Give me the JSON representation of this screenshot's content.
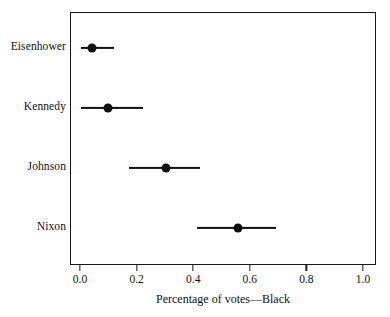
{
  "chart_data": {
    "type": "scatter",
    "title": "",
    "subtitle": "",
    "xlabel": "Percentage of votes—Black",
    "ylabel": "",
    "xlim": [
      0.0,
      1.0
    ],
    "xticks": [
      0.0,
      0.2,
      0.4,
      0.6,
      0.8,
      1.0
    ],
    "xtick_labels": [
      "0.0",
      "0.2",
      "0.4",
      "0.6",
      "0.8",
      "1.0"
    ],
    "categories": [
      "Eisenhower",
      "Kennedy",
      "Johnson",
      "Nixon"
    ],
    "grid": false,
    "legend": null,
    "series": [
      {
        "name": "Percentage of votes—Black",
        "marker": "filled-circle",
        "color": "#111111",
        "points": [
          {
            "category": "Eisenhower",
            "value": 0.04,
            "low": 0.0,
            "high": 0.115
          },
          {
            "category": "Kennedy",
            "value": 0.095,
            "low": 0.0,
            "high": 0.22
          },
          {
            "category": "Johnson",
            "value": 0.3,
            "low": 0.17,
            "high": 0.42
          },
          {
            "category": "Nixon",
            "value": 0.555,
            "low": 0.41,
            "high": 0.69
          }
        ]
      }
    ]
  },
  "figure": {
    "background_color": "#ffffff",
    "frame_color": "#1a1a1a",
    "marker_color": "#111111"
  }
}
